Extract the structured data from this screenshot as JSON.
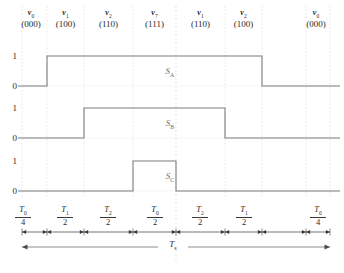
{
  "figure": {
    "type": "timing-diagram"
  },
  "vectors": [
    {
      "name": "v",
      "index": "0",
      "code": "(000)"
    },
    {
      "name": "v",
      "index": "1",
      "code": "(100)"
    },
    {
      "name": "v",
      "index": "2",
      "code": "(110)"
    },
    {
      "name": "v",
      "index": "7",
      "code": "(111)"
    },
    {
      "name": "v",
      "index": "1",
      "code": "(110)"
    },
    {
      "name": "v",
      "index": "2",
      "code": "(100)"
    },
    {
      "name": "v",
      "index": "0",
      "code": "(000)"
    }
  ],
  "axis": {
    "high_label": "1",
    "low_label": "0"
  },
  "waveforms": [
    {
      "name": "S",
      "sub": "A",
      "high_start_segment": 1,
      "high_end_segment": 6
    },
    {
      "name": "S",
      "sub": "B",
      "high_start_segment": 2,
      "high_end_segment": 5
    },
    {
      "name": "S",
      "sub": "C",
      "high_start_segment": 3,
      "high_end_segment": 4
    }
  ],
  "segments": [
    {
      "num": "T",
      "num_sub": "0",
      "den": "4"
    },
    {
      "num": "T",
      "num_sub": "1",
      "den": "2"
    },
    {
      "num": "T",
      "num_sub": "2",
      "den": "2"
    },
    {
      "num": "T",
      "num_sub": "0",
      "den": "2"
    },
    {
      "num": "T",
      "num_sub": "2",
      "den": "2"
    },
    {
      "num": "T",
      "num_sub": "1",
      "den": "2"
    },
    {
      "num": "T",
      "num_sub": "0",
      "den": "4"
    }
  ],
  "total_period": {
    "name": "T",
    "sub": "s"
  },
  "colors": {
    "trace": "#7d7d7d",
    "grid": "#dcdcdc",
    "center_grid": "#d8d8d8",
    "arrow": "#3a3a3a",
    "text": "#2b2b2b"
  },
  "chart_data": {
    "type": "line",
    "xlabel": "",
    "ylabel": "",
    "ylim": [
      0,
      1
    ],
    "boundaries_px": [
      22,
      47,
      84,
      133,
      176,
      225,
      262,
      306,
      330
    ],
    "categories": [
      "T0/4",
      "T1/2",
      "T2/2",
      "T0/2",
      "T2/2",
      "T1/2",
      "T0/4"
    ],
    "series": [
      {
        "name": "S_A",
        "values": [
          0,
          1,
          1,
          1,
          1,
          1,
          0
        ]
      },
      {
        "name": "S_B",
        "values": [
          0,
          0,
          1,
          1,
          1,
          0,
          0
        ]
      },
      {
        "name": "S_C",
        "values": [
          0,
          0,
          0,
          1,
          0,
          0,
          0
        ]
      }
    ],
    "legend": "none",
    "grid": true
  }
}
